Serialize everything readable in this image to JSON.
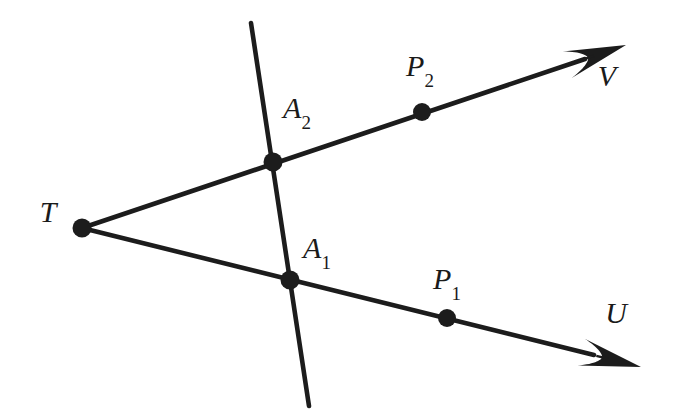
{
  "figure": {
    "background_color": "#ffffff",
    "stroke_color": "#1c1c1c",
    "line_width": 4.5,
    "dot_radius": 9,
    "width": 676,
    "height": 416
  },
  "labels": {
    "T": {
      "text": "T",
      "x": 48,
      "y": 212
    },
    "A2": {
      "base": "A",
      "sub": "2",
      "x": 297,
      "y": 110
    },
    "A1": {
      "base": "A",
      "sub": "1",
      "x": 317,
      "y": 250
    },
    "P2": {
      "base": "P",
      "sub": "2",
      "x": 420,
      "y": 68
    },
    "P1": {
      "base": "P",
      "sub": "1",
      "x": 447,
      "y": 281
    },
    "V": {
      "text": "V",
      "x": 607,
      "y": 76
    },
    "U": {
      "text": "U",
      "x": 616,
      "y": 313
    }
  },
  "points": [
    {
      "name": "T",
      "x": 82,
      "y": 228,
      "kind": "apex"
    },
    {
      "name": "A2",
      "x": 273,
      "y": 162,
      "kind": "intersection"
    },
    {
      "name": "A1",
      "x": 290,
      "y": 280,
      "kind": "intersection"
    },
    {
      "name": "P2",
      "x": 422,
      "y": 112,
      "kind": "ray-point"
    },
    {
      "name": "P1",
      "x": 447,
      "y": 318,
      "kind": "ray-point"
    }
  ],
  "rays": [
    {
      "name": "ray-TV",
      "from": "T",
      "through": [
        "A2",
        "P2"
      ],
      "to": "V",
      "start": {
        "x": 82,
        "y": 228
      },
      "end": {
        "x": 626,
        "y": 45
      },
      "arrowhead": true
    },
    {
      "name": "ray-TU",
      "from": "T",
      "through": [
        "A1",
        "P1"
      ],
      "to": "U",
      "start": {
        "x": 82,
        "y": 228
      },
      "end": {
        "x": 641,
        "y": 367
      },
      "arrowhead": true
    }
  ],
  "transversal": {
    "name": "line-A2-A1",
    "through": [
      "A2",
      "A1"
    ],
    "start": {
      "x": 251,
      "y": 23
    },
    "end": {
      "x": 309,
      "y": 406
    },
    "arrowhead": false
  }
}
